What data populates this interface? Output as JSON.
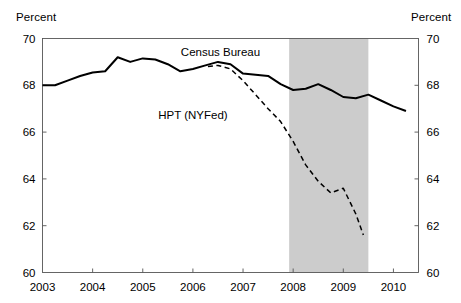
{
  "chart_data": {
    "type": "line",
    "title": "",
    "xlabel": "",
    "ylabel": "Percent",
    "ylabel_right": "Percent",
    "xlim": [
      2003.0,
      2010.5
    ],
    "ylim": [
      60,
      70
    ],
    "yticks": [
      60,
      62,
      64,
      66,
      68,
      70
    ],
    "ytick_labels": [
      "60",
      "62",
      "64",
      "66",
      "68",
      "70"
    ],
    "xticks": [
      2003,
      2004,
      2005,
      2006,
      2007,
      2008,
      2009,
      2010
    ],
    "xtick_labels": [
      "2003",
      "2004",
      "2005",
      "2006",
      "2007",
      "2008",
      "2009",
      "2010"
    ],
    "grid": false,
    "legend_position": "inline-annotations",
    "shaded_regions": [
      {
        "name": "recession",
        "x_start": 2007.92,
        "x_end": 2009.5,
        "color": "#cccccc"
      }
    ],
    "annotations": [
      {
        "text": "Census Bureau",
        "x": 2006.55,
        "y": 69.25
      },
      {
        "text": "HPT (NYFed)",
        "x": 2006.0,
        "y": 66.55
      }
    ],
    "series": [
      {
        "name": "Census Bureau",
        "style": "solid",
        "color": "#000000",
        "x": [
          2003.0,
          2003.25,
          2003.5,
          2003.75,
          2004.0,
          2004.25,
          2004.5,
          2004.75,
          2005.0,
          2005.25,
          2005.5,
          2005.75,
          2006.0,
          2006.25,
          2006.5,
          2006.75,
          2007.0,
          2007.25,
          2007.5,
          2007.75,
          2008.0,
          2008.25,
          2008.5,
          2008.75,
          2009.0,
          2009.25,
          2009.5,
          2009.75,
          2010.0,
          2010.25
        ],
        "values": [
          68.0,
          68.0,
          68.2,
          68.4,
          68.55,
          68.6,
          69.2,
          69.0,
          69.15,
          69.1,
          68.9,
          68.6,
          68.7,
          68.85,
          69.0,
          68.9,
          68.5,
          68.45,
          68.4,
          68.05,
          67.8,
          67.85,
          68.05,
          67.8,
          67.5,
          67.45,
          67.6,
          67.35,
          67.1,
          66.9
        ]
      },
      {
        "name": "HPT (NYFed)",
        "style": "dashed",
        "color": "#000000",
        "x": [
          2006.3,
          2006.5,
          2006.75,
          2007.0,
          2007.25,
          2007.5,
          2007.75,
          2008.0,
          2008.25,
          2008.5,
          2008.75,
          2009.0,
          2009.25,
          2009.4
        ],
        "values": [
          68.8,
          68.85,
          68.7,
          68.2,
          67.6,
          67.0,
          66.45,
          65.6,
          64.6,
          63.9,
          63.4,
          63.6,
          62.5,
          61.6
        ]
      }
    ]
  },
  "axes": {
    "left_unit": "Percent",
    "right_unit": "Percent"
  }
}
